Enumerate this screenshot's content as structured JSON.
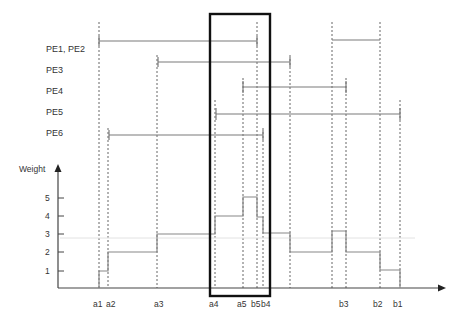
{
  "diagram": {
    "type": "interval-weight-diagram",
    "colors": {
      "line": "#7a7a7a",
      "axis": "#444444",
      "box": "#111111",
      "dotted": "#666666",
      "text": "#333333"
    },
    "y_axis": {
      "label": "Weight",
      "ticks": [
        "1",
        "2",
        "3",
        "4",
        "5"
      ]
    },
    "x_labels": [
      {
        "id": "a1",
        "label": "a1"
      },
      {
        "id": "a2",
        "label": "a2"
      },
      {
        "id": "a3",
        "label": "a3"
      },
      {
        "id": "a4",
        "label": "a4"
      },
      {
        "id": "a5",
        "label": "a5"
      },
      {
        "id": "b5",
        "label": "b5"
      },
      {
        "id": "b4",
        "label": "b4"
      },
      {
        "id": "b3",
        "label": "b3"
      },
      {
        "id": "b2",
        "label": "b2"
      },
      {
        "id": "b1",
        "label": "b1"
      }
    ],
    "intervals": [
      {
        "label": "PE1, PE2"
      },
      {
        "label": "PE3"
      },
      {
        "label": "PE4"
      },
      {
        "label": "PE5"
      },
      {
        "label": "PE6"
      }
    ],
    "weight_steps": [
      {
        "from": "a1",
        "to": "a2",
        "weight": 1
      },
      {
        "from": "a2",
        "to": "a3",
        "weight": 2
      },
      {
        "from": "a3",
        "to": "a4",
        "weight": 3
      },
      {
        "from": "a4",
        "to": "a5",
        "weight": 4
      },
      {
        "from": "a5",
        "to": "b5",
        "weight": 5
      },
      {
        "from": "b5",
        "to": "b4",
        "weight": 4
      },
      {
        "from": "b4",
        "to": "PE3-end",
        "weight": 3
      },
      {
        "from": "PE3-end",
        "to": "b3",
        "weight": 2
      },
      {
        "from": "b3",
        "to": "PE4-end",
        "weight": 3
      },
      {
        "from": "PE4-end",
        "to": "b2",
        "weight": 2
      },
      {
        "from": "b2",
        "to": "b1",
        "weight": 1
      }
    ],
    "highlight_box": {
      "from": "a4",
      "to": "b4"
    }
  }
}
